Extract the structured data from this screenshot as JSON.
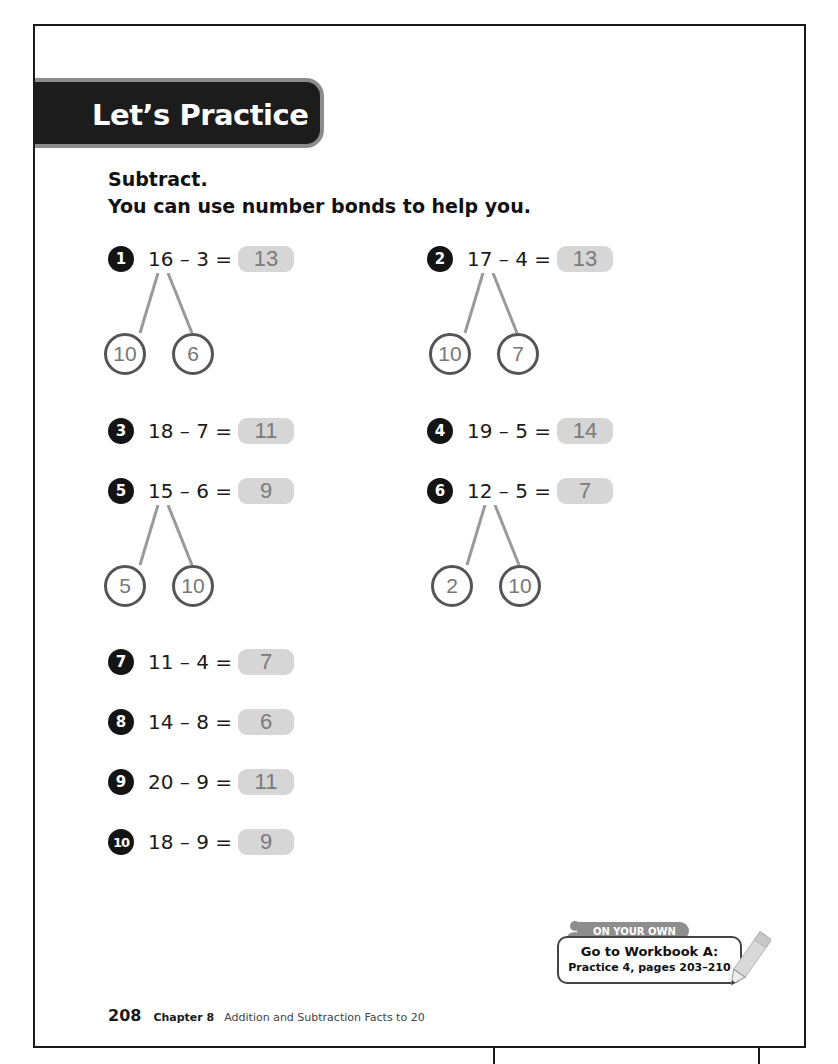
{
  "banner": {
    "title": "Let’s Practice"
  },
  "instructions": {
    "line1": "Subtract.",
    "line2": "You can use number bonds to help you."
  },
  "problems": [
    {
      "number": "1",
      "expression": "16 – 3 =",
      "answer": "13",
      "bond": [
        "10",
        "6"
      ]
    },
    {
      "number": "2",
      "expression": "17 – 4 =",
      "answer": "13",
      "bond": [
        "10",
        "7"
      ]
    },
    {
      "number": "3",
      "expression": "18 – 7 =",
      "answer": "11"
    },
    {
      "number": "4",
      "expression": "19 – 5 =",
      "answer": "14"
    },
    {
      "number": "5",
      "expression": "15 – 6 =",
      "answer": "9",
      "bond": [
        "5",
        "10"
      ]
    },
    {
      "number": "6",
      "expression": "12 – 5 =",
      "answer": "7",
      "bond": [
        "2",
        "10"
      ]
    },
    {
      "number": "7",
      "expression": "11 – 4 =",
      "answer": "7"
    },
    {
      "number": "8",
      "expression": "14 – 8 =",
      "answer": "6"
    },
    {
      "number": "9",
      "expression": "20 – 9 =",
      "answer": "11"
    },
    {
      "number": "10",
      "expression": "18 – 9 =",
      "answer": "9"
    }
  ],
  "on_your_own": {
    "tab_label": "ON YOUR OWN",
    "line1": "Go to Workbook A:",
    "line2": "Practice 4, pages 203–210",
    "icons": [
      "person-icon",
      "pencil-icon"
    ]
  },
  "footer": {
    "page_number": "208",
    "chapter": "Chapter 8",
    "chapter_title": "Addition and Subtraction Facts to 20"
  },
  "colors": {
    "banner_bg": "#1c1c1c",
    "banner_border": "#8c8c8c",
    "answer_bg": "#d6d6d6",
    "answer_text": "#7a7a7a",
    "badge_bg": "#141414",
    "bond_line": "#9a9a9a"
  }
}
